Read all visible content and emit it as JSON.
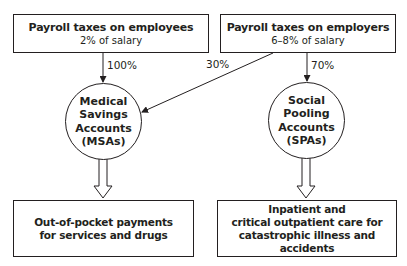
{
  "sources": [
    {
      "title": "Payroll taxes on employees",
      "subtitle": "2% of salary"
    },
    {
      "title": "Payroll taxes on employers",
      "subtitle": "6–8% of salary"
    }
  ],
  "flows": {
    "employees_to_msa": "100%",
    "employers_to_msa": "30%",
    "employers_to_spa": "70%"
  },
  "accounts": [
    {
      "lines": [
        "Medical",
        "Savings",
        "Accounts",
        "(MSAs)"
      ]
    },
    {
      "lines": [
        "Social",
        "Pooling",
        "Accounts",
        "(SPAs)"
      ]
    }
  ],
  "uses": [
    {
      "lines": [
        "Out-of-pocket payments",
        "for services and drugs"
      ]
    },
    {
      "lines": [
        "Inpatient and",
        "critical outpatient care for",
        "catastrophic illness and accidents"
      ]
    }
  ],
  "colors": {
    "stroke": "#231f20",
    "background": "#ffffff"
  }
}
